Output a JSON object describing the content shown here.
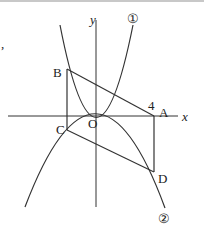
{
  "diagram": {
    "type": "coordinate-geometry",
    "axes": {
      "x_label": "x",
      "y_label": "y",
      "origin_label": "O"
    },
    "curves": [
      {
        "id": "curve-1",
        "label": "①",
        "shape": "upward parabola through origin"
      },
      {
        "id": "curve-2",
        "label": "②",
        "shape": "downward parabola through origin"
      }
    ],
    "points": {
      "A": {
        "label": "A",
        "on": "x-axis",
        "x_tick": "4"
      },
      "B": {
        "label": "B",
        "on": "curve-1"
      },
      "C": {
        "label": "C",
        "on": "curve-2"
      },
      "D": {
        "label": "D",
        "on": "curve-2"
      }
    },
    "tick_label_A": "4",
    "segments": [
      "BA",
      "BC",
      "CD",
      "AD"
    ],
    "stray_mark": ","
  }
}
